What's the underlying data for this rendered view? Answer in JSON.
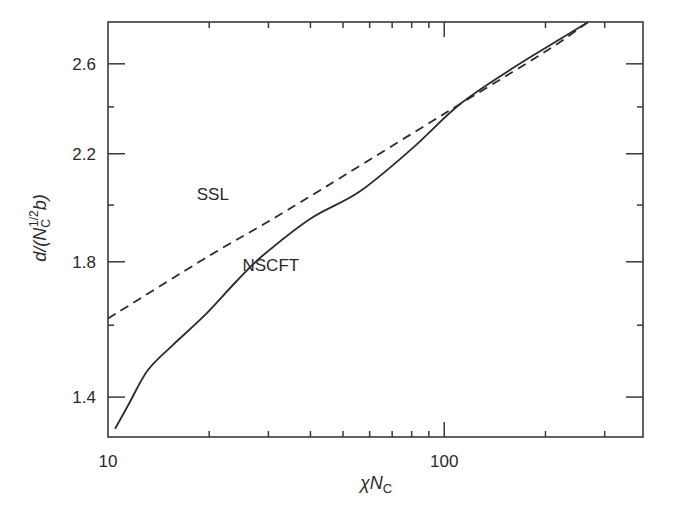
{
  "chart_data": {
    "type": "line",
    "title": "",
    "xlabel": "χN_C",
    "ylabel": "d/(N_C^{1/2} b)",
    "xscale": "log",
    "yscale": "log",
    "xlim": [
      10,
      390
    ],
    "ylim": [
      1.3,
      2.81
    ],
    "grid": false,
    "legend": "inline labels",
    "x_ticks": {
      "major": [
        {
          "value": 10,
          "label": "10"
        },
        {
          "value": 100,
          "label": "100"
        }
      ],
      "minor": [
        20,
        30,
        40,
        50,
        60,
        70,
        80,
        90,
        200,
        300
      ]
    },
    "y_ticks": {
      "major": [
        {
          "value": 1.4,
          "label": "1.4"
        },
        {
          "value": 1.8,
          "label": "1.8"
        },
        {
          "value": 2.2,
          "label": "2.2"
        },
        {
          "value": 2.6,
          "label": "2.6"
        }
      ],
      "minor": [
        1.6,
        2.0,
        2.4
      ]
    },
    "series": [
      {
        "name": "SSL",
        "style": "dashed",
        "x": [
          10,
          20,
          30,
          50,
          100,
          200,
          268
        ],
        "y": [
          1.62,
          1.82,
          1.94,
          2.11,
          2.37,
          2.66,
          2.81
        ]
      },
      {
        "name": "NSCFT",
        "style": "solid",
        "x": [
          10.5,
          11.5,
          13.1,
          15.5,
          19.4,
          24.3,
          28.8,
          40,
          55.9,
          80,
          110.8,
          160,
          220,
          268
        ],
        "y": [
          1.32,
          1.38,
          1.47,
          1.54,
          1.63,
          1.74,
          1.82,
          1.95,
          2.05,
          2.22,
          2.41,
          2.58,
          2.72,
          2.81
        ]
      }
    ],
    "annotations": [
      {
        "text": "SSL",
        "x": 20.5,
        "y": 2.02
      },
      {
        "text": "NSCFT",
        "x": 30.5,
        "y": 1.77
      }
    ]
  },
  "labels": {
    "x_axis_main": "χN",
    "x_axis_sub": "C",
    "y_axis_pre": "d/(N",
    "y_axis_sub": "C",
    "y_axis_sup": "1/2",
    "y_axis_post": "b)"
  },
  "colors": {
    "axis": "#3a3a3a",
    "line": "#2b2b2b",
    "text": "#2a2a2a"
  }
}
